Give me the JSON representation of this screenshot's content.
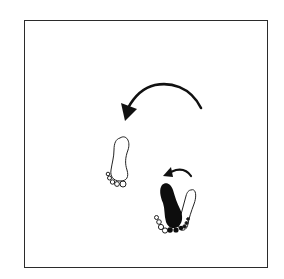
{
  "diagram": {
    "type": "dance-step-footprints",
    "colors": {
      "ink": "#111111",
      "frame": "#2b2b2b",
      "background": "#ffffff"
    },
    "elements": [
      {
        "id": "large-turn-arrow",
        "kind": "arrow",
        "direction": "counter-clockwise"
      },
      {
        "id": "open-left-footprint",
        "kind": "footprint",
        "fill": "outline"
      },
      {
        "id": "small-turn-arrow",
        "kind": "arrow",
        "direction": "counter-clockwise"
      },
      {
        "id": "filled-footprint",
        "kind": "footprint",
        "fill": "solid"
      },
      {
        "id": "open-right-footprint",
        "kind": "footprint",
        "fill": "outline"
      }
    ]
  }
}
